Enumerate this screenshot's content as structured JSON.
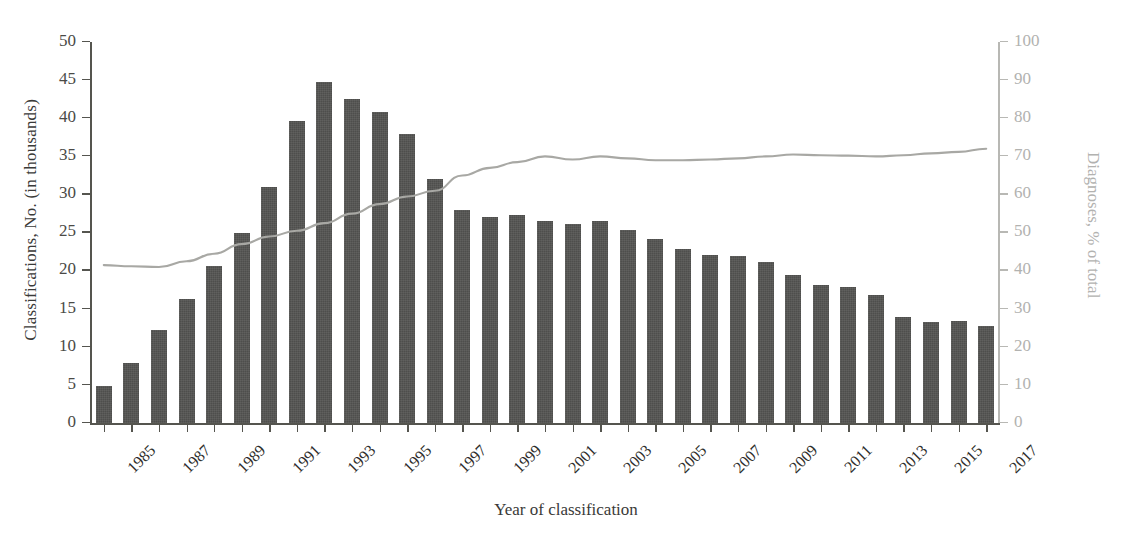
{
  "chart_data": {
    "type": "bar",
    "title": "",
    "xlabel": "Year of classification",
    "ylabel": "Classifications, No. (in thousands)",
    "y2label": "Diagnoses, % of total",
    "grid": false,
    "legend": "none",
    "ylim": [
      0,
      50
    ],
    "y2lim": [
      0,
      100
    ],
    "yticks": [
      0,
      5,
      10,
      15,
      20,
      25,
      30,
      35,
      40,
      45,
      50
    ],
    "y2ticks": [
      0,
      10,
      20,
      30,
      40,
      50,
      60,
      70,
      80,
      90,
      100
    ],
    "x": [
      1985,
      1986,
      1987,
      1988,
      1989,
      1990,
      1991,
      1992,
      1993,
      1994,
      1995,
      1996,
      1997,
      1998,
      1999,
      2000,
      2001,
      2002,
      2003,
      2004,
      2005,
      2006,
      2007,
      2008,
      2009,
      2010,
      2011,
      2012,
      2013,
      2014,
      2015,
      2016,
      2017
    ],
    "xtick_labels": [
      "1985",
      "1987",
      "1989",
      "1991",
      "1993",
      "1995",
      "1997",
      "1999",
      "2001",
      "2003",
      "2005",
      "2007",
      "2009",
      "2011",
      "2013",
      "2015",
      "2017"
    ],
    "xtick_values": [
      1985,
      1987,
      1989,
      1991,
      1993,
      1995,
      1997,
      1999,
      2001,
      2003,
      2005,
      2007,
      2009,
      2011,
      2013,
      2015,
      2017
    ],
    "series": [
      {
        "name": "Classifications, No. (in thousands)",
        "render": "bar",
        "axis": "left",
        "color": "#4e4e4c",
        "values": [
          4.9,
          7.9,
          12.2,
          16.3,
          20.6,
          25.0,
          31.0,
          39.6,
          44.8,
          42.5,
          40.8,
          37.9,
          32.0,
          28.0,
          27.0,
          27.3,
          26.5,
          26.1,
          26.6,
          25.4,
          24.2,
          22.9,
          22.1,
          22.0,
          21.2,
          19.5,
          18.1,
          17.9,
          16.9,
          13.9,
          13.3,
          13.4,
          12.8
        ]
      },
      {
        "name": "Diagnoses, % of total",
        "render": "line",
        "axis": "right",
        "color": "#a8a8a4",
        "values": [
          41.5,
          41.2,
          41.0,
          42.5,
          44.5,
          47.0,
          49.0,
          50.5,
          52.5,
          55.0,
          57.5,
          59.5,
          61.0,
          65.0,
          67.0,
          68.5,
          70.0,
          69.2,
          70.0,
          69.5,
          69.0,
          69.0,
          69.2,
          69.5,
          70.0,
          70.5,
          70.3,
          70.2,
          70.0,
          70.3,
          70.8,
          71.2,
          72.0
        ]
      }
    ]
  }
}
